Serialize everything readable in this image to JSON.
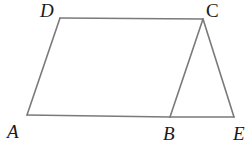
{
  "figure": {
    "type": "geometry-diagram",
    "line_color": "#7a7a7a",
    "label_color": "#1a1a1a",
    "points": {
      "A": {
        "label": "A",
        "x": 27,
        "y": 115,
        "label_x": 7,
        "label_y": 138
      },
      "B": {
        "label": "B",
        "x": 170,
        "y": 117,
        "label_x": 163,
        "label_y": 140
      },
      "C": {
        "label": "C",
        "x": 203,
        "y": 19,
        "label_x": 206,
        "label_y": 17
      },
      "D": {
        "label": "D",
        "x": 60,
        "y": 18,
        "label_x": 40,
        "label_y": 17
      },
      "E": {
        "label": "E",
        "x": 234,
        "y": 117,
        "label_x": 233,
        "label_y": 140
      }
    },
    "segments": [
      {
        "from": "A",
        "to": "D"
      },
      {
        "from": "D",
        "to": "C"
      },
      {
        "from": "C",
        "to": "B"
      },
      {
        "from": "A",
        "to": "B"
      },
      {
        "from": "B",
        "to": "E"
      },
      {
        "from": "C",
        "to": "E"
      }
    ],
    "shapes": [
      {
        "name": "parallelogram",
        "vertices": [
          "A",
          "B",
          "C",
          "D"
        ]
      },
      {
        "name": "triangle",
        "vertices": [
          "B",
          "C",
          "E"
        ]
      }
    ]
  }
}
